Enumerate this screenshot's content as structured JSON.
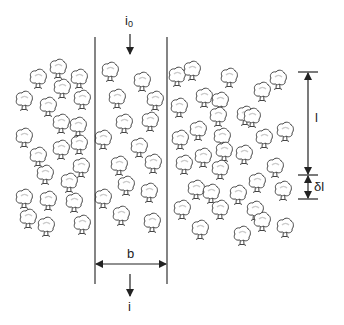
{
  "diagram": {
    "type": "forest-strip-schematic",
    "colors": {
      "line": "#333333",
      "tree_outline": "#444444",
      "tree_fill": "#ffffff",
      "tree_highlight": "#d8d8d8",
      "background": "#ffffff"
    },
    "strip": {
      "left_x": 95,
      "right_x": 167,
      "top_y": 37,
      "bottom_y": 284
    },
    "labels": {
      "incoming": "i",
      "incoming_sub": "0",
      "outgoing": "i",
      "width": "b",
      "length": "l",
      "delta_length": "δl"
    },
    "dimension_l": {
      "x": 308,
      "top_y": 72,
      "bottom_y": 175
    },
    "dimension_dl": {
      "x": 308,
      "top_y": 175,
      "bottom_y": 199
    },
    "dimension_b": {
      "y": 264,
      "left_x": 95,
      "right_x": 167
    },
    "trees": [
      [
        38,
        79
      ],
      [
        58,
        69
      ],
      [
        79,
        79
      ],
      [
        62,
        89
      ],
      [
        24,
        101
      ],
      [
        48,
        107
      ],
      [
        82,
        100
      ],
      [
        61,
        124
      ],
      [
        78,
        127
      ],
      [
        24,
        138
      ],
      [
        79,
        145
      ],
      [
        61,
        150
      ],
      [
        38,
        157
      ],
      [
        45,
        175
      ],
      [
        81,
        168
      ],
      [
        69,
        183
      ],
      [
        24,
        199
      ],
      [
        48,
        201
      ],
      [
        74,
        203
      ],
      [
        28,
        219
      ],
      [
        46,
        227
      ],
      [
        82,
        225
      ],
      [
        110,
        72
      ],
      [
        142,
        82
      ],
      [
        117,
        99
      ],
      [
        155,
        101
      ],
      [
        124,
        124
      ],
      [
        150,
        122
      ],
      [
        103,
        140
      ],
      [
        139,
        148
      ],
      [
        119,
        166
      ],
      [
        153,
        164
      ],
      [
        126,
        186
      ],
      [
        103,
        199
      ],
      [
        149,
        193
      ],
      [
        121,
        216
      ],
      [
        152,
        223
      ],
      [
        177,
        77
      ],
      [
        192,
        71
      ],
      [
        229,
        78
      ],
      [
        262,
        92
      ],
      [
        278,
        80
      ],
      [
        204,
        98
      ],
      [
        220,
        102
      ],
      [
        179,
        108
      ],
      [
        218,
        117
      ],
      [
        245,
        116
      ],
      [
        198,
        131
      ],
      [
        180,
        140
      ],
      [
        222,
        138
      ],
      [
        252,
        118
      ],
      [
        264,
        139
      ],
      [
        285,
        132
      ],
      [
        244,
        155
      ],
      [
        184,
        165
      ],
      [
        203,
        158
      ],
      [
        224,
        152
      ],
      [
        220,
        170
      ],
      [
        196,
        190
      ],
      [
        211,
        194
      ],
      [
        238,
        195
      ],
      [
        257,
        183
      ],
      [
        182,
        210
      ],
      [
        220,
        210
      ],
      [
        255,
        211
      ],
      [
        200,
        230
      ],
      [
        242,
        236
      ],
      [
        262,
        222
      ],
      [
        275,
        168
      ],
      [
        283,
        191
      ],
      [
        285,
        228
      ]
    ]
  }
}
